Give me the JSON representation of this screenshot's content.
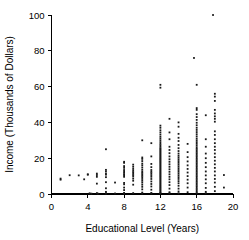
{
  "chart_data": {
    "type": "scatter",
    "title": "",
    "xlabel": "Educational Level (Years)",
    "ylabel": "Income (Thousands of Dollars)",
    "xlim": [
      0,
      20
    ],
    "ylim": [
      0,
      100
    ],
    "xticks": [
      0,
      4,
      8,
      12,
      16,
      20
    ],
    "yticks": [
      0,
      20,
      40,
      60,
      80,
      100
    ],
    "grid": false,
    "legend": null,
    "marker_color": "#1a1a1a",
    "axis_color": "#000000",
    "background": "#ffffff",
    "n_points": 330,
    "points": [
      [
        1,
        8
      ],
      [
        1,
        8.6
      ],
      [
        2,
        10.5
      ],
      [
        3,
        10.4
      ],
      [
        3.6,
        8.2
      ],
      [
        4,
        10.8
      ],
      [
        4,
        11
      ],
      [
        4.2,
        0.4
      ],
      [
        4.4,
        0.2
      ],
      [
        5,
        9.6
      ],
      [
        5,
        10.6
      ],
      [
        5,
        11.4
      ],
      [
        5,
        5.8
      ],
      [
        5,
        0.5
      ],
      [
        5.1,
        0.2
      ],
      [
        6,
        25
      ],
      [
        6,
        13.5
      ],
      [
        6,
        12.6
      ],
      [
        6,
        11.4
      ],
      [
        6,
        10.8
      ],
      [
        6,
        9.4
      ],
      [
        6,
        6.6
      ],
      [
        6,
        3.2
      ],
      [
        6,
        1.2
      ],
      [
        6,
        0.4
      ],
      [
        6,
        0.2
      ],
      [
        7,
        6.4
      ],
      [
        7,
        0.3
      ],
      [
        8,
        18
      ],
      [
        8,
        17.4
      ],
      [
        8,
        15.6
      ],
      [
        8,
        14.6
      ],
      [
        8,
        13.4
      ],
      [
        8,
        12.6
      ],
      [
        8,
        11.8
      ],
      [
        8,
        11
      ],
      [
        8,
        10.4
      ],
      [
        8,
        9.6
      ],
      [
        8,
        6.2
      ],
      [
        8,
        5.4
      ],
      [
        8,
        3.6
      ],
      [
        8,
        2.2
      ],
      [
        8,
        0.6
      ],
      [
        8,
        0.3
      ],
      [
        9,
        16.4
      ],
      [
        9,
        15.2
      ],
      [
        9,
        14
      ],
      [
        9,
        13
      ],
      [
        9,
        12.2
      ],
      [
        9,
        11.4
      ],
      [
        9,
        10.6
      ],
      [
        9,
        9.8
      ],
      [
        9,
        8.6
      ],
      [
        9,
        7.4
      ],
      [
        9,
        5.2
      ],
      [
        9,
        0.5
      ],
      [
        10,
        30
      ],
      [
        10,
        20.4
      ],
      [
        10,
        19.6
      ],
      [
        10,
        18.4
      ],
      [
        10,
        17
      ],
      [
        10,
        16
      ],
      [
        10,
        14.8
      ],
      [
        10,
        13.6
      ],
      [
        10,
        12.6
      ],
      [
        10,
        11.8
      ],
      [
        10,
        11
      ],
      [
        10,
        10.2
      ],
      [
        10,
        9.4
      ],
      [
        10,
        8.4
      ],
      [
        10,
        7.4
      ],
      [
        10,
        6.4
      ],
      [
        10,
        5.2
      ],
      [
        10,
        4
      ],
      [
        10,
        2.6
      ],
      [
        10,
        0.8
      ],
      [
        10,
        0.3
      ],
      [
        11,
        28.4
      ],
      [
        11,
        21
      ],
      [
        11,
        16.8
      ],
      [
        11,
        15
      ],
      [
        11,
        13.4
      ],
      [
        11,
        12.4
      ],
      [
        11,
        11.6
      ],
      [
        11,
        10.6
      ],
      [
        11,
        9.6
      ],
      [
        11,
        8.4
      ],
      [
        11,
        7
      ],
      [
        11,
        5.6
      ],
      [
        11,
        4.2
      ],
      [
        11,
        2.4
      ],
      [
        11,
        0.6
      ],
      [
        11,
        0.3
      ],
      [
        12,
        61
      ],
      [
        12,
        59.4
      ],
      [
        12,
        38.2
      ],
      [
        12,
        37
      ],
      [
        12,
        35.6
      ],
      [
        12,
        34.4
      ],
      [
        12,
        33.2
      ],
      [
        12,
        32
      ],
      [
        12,
        31
      ],
      [
        12,
        30
      ],
      [
        12,
        29
      ],
      [
        12,
        28
      ],
      [
        12,
        27.2
      ],
      [
        12,
        26.4
      ],
      [
        12,
        25.6
      ],
      [
        12,
        25
      ],
      [
        12,
        24.4
      ],
      [
        12,
        23.8
      ],
      [
        12,
        23.2
      ],
      [
        12,
        22.6
      ],
      [
        12,
        22
      ],
      [
        12,
        21.4
      ],
      [
        12,
        20.8
      ],
      [
        12,
        20.2
      ],
      [
        12,
        19.6
      ],
      [
        12,
        19
      ],
      [
        12,
        18.4
      ],
      [
        12,
        17.8
      ],
      [
        12,
        17.2
      ],
      [
        12,
        16.6
      ],
      [
        12,
        16
      ],
      [
        12,
        15.4
      ],
      [
        12,
        14.8
      ],
      [
        12,
        14.2
      ],
      [
        12,
        13.6
      ],
      [
        12,
        13
      ],
      [
        12,
        12.4
      ],
      [
        12,
        11.8
      ],
      [
        12,
        11.2
      ],
      [
        12,
        10.6
      ],
      [
        12,
        10
      ],
      [
        12,
        9.4
      ],
      [
        12,
        8.8
      ],
      [
        12,
        8.2
      ],
      [
        12,
        7.6
      ],
      [
        12,
        7
      ],
      [
        12,
        6.4
      ],
      [
        12,
        5.8
      ],
      [
        12,
        5.2
      ],
      [
        12,
        4.6
      ],
      [
        12,
        4
      ],
      [
        12,
        3.4
      ],
      [
        12,
        2.8
      ],
      [
        12,
        2.2
      ],
      [
        12,
        1.6
      ],
      [
        12,
        1
      ],
      [
        12,
        0.6
      ],
      [
        12,
        0.3
      ],
      [
        13,
        42
      ],
      [
        13,
        34.4
      ],
      [
        13,
        30.6
      ],
      [
        13,
        26.4
      ],
      [
        13,
        24.6
      ],
      [
        13,
        22.8
      ],
      [
        13,
        21
      ],
      [
        13,
        19.4
      ],
      [
        13,
        18
      ],
      [
        13,
        16.6
      ],
      [
        13,
        15.2
      ],
      [
        13,
        13.8
      ],
      [
        13,
        12.4
      ],
      [
        13,
        11
      ],
      [
        13,
        9.6
      ],
      [
        13,
        8.2
      ],
      [
        13,
        6.6
      ],
      [
        13,
        5
      ],
      [
        13,
        3
      ],
      [
        13,
        1
      ],
      [
        13,
        0.4
      ],
      [
        14,
        40
      ],
      [
        14,
        37.6
      ],
      [
        14,
        33.6
      ],
      [
        14,
        31.4
      ],
      [
        14,
        29.6
      ],
      [
        14,
        27.4
      ],
      [
        14,
        25.6
      ],
      [
        14,
        24
      ],
      [
        14,
        22.6
      ],
      [
        14,
        21.4
      ],
      [
        14,
        20.4
      ],
      [
        14,
        19.4
      ],
      [
        14,
        18.4
      ],
      [
        14,
        17.4
      ],
      [
        14,
        16.4
      ],
      [
        14,
        15.4
      ],
      [
        14,
        14.4
      ],
      [
        14,
        13.4
      ],
      [
        14,
        12.4
      ],
      [
        14,
        11.4
      ],
      [
        14,
        10.4
      ],
      [
        14,
        9.4
      ],
      [
        14,
        8.4
      ],
      [
        14,
        7.2
      ],
      [
        14,
        6
      ],
      [
        14,
        4.6
      ],
      [
        14,
        3
      ],
      [
        14,
        1.4
      ],
      [
        14,
        0.4
      ],
      [
        15,
        28
      ],
      [
        15,
        23.4
      ],
      [
        15,
        20.6
      ],
      [
        15,
        18.2
      ],
      [
        15,
        16
      ],
      [
        15,
        14
      ],
      [
        15,
        12
      ],
      [
        15,
        10
      ],
      [
        15,
        8
      ],
      [
        15,
        6
      ],
      [
        15,
        3.6
      ],
      [
        15,
        1
      ],
      [
        15.7,
        76
      ],
      [
        16,
        61
      ],
      [
        16,
        48
      ],
      [
        16,
        47
      ],
      [
        16,
        44.6
      ],
      [
        16,
        43
      ],
      [
        16,
        41.4
      ],
      [
        16,
        39.8
      ],
      [
        16,
        38.4
      ],
      [
        16,
        37
      ],
      [
        16,
        35.8
      ],
      [
        16,
        34.6
      ],
      [
        16,
        33.4
      ],
      [
        16,
        32.2
      ],
      [
        16,
        31
      ],
      [
        16,
        30
      ],
      [
        16,
        29
      ],
      [
        16,
        28
      ],
      [
        16,
        27
      ],
      [
        16,
        26
      ],
      [
        16,
        25.2
      ],
      [
        16,
        24.4
      ],
      [
        16,
        23.6
      ],
      [
        16,
        22.8
      ],
      [
        16,
        22
      ],
      [
        16,
        21.2
      ],
      [
        16,
        20.4
      ],
      [
        16,
        19.6
      ],
      [
        16,
        18.8
      ],
      [
        16,
        18
      ],
      [
        16,
        17.2
      ],
      [
        16,
        16.4
      ],
      [
        16,
        15.6
      ],
      [
        16,
        14.8
      ],
      [
        16,
        14
      ],
      [
        16,
        13.2
      ],
      [
        16,
        12.4
      ],
      [
        16,
        11.6
      ],
      [
        16,
        10.8
      ],
      [
        16,
        10
      ],
      [
        16,
        9.2
      ],
      [
        16,
        8.4
      ],
      [
        16,
        7.6
      ],
      [
        16,
        6.8
      ],
      [
        16,
        6
      ],
      [
        16,
        5.2
      ],
      [
        16,
        4.4
      ],
      [
        16,
        3.6
      ],
      [
        16,
        2.8
      ],
      [
        16,
        2
      ],
      [
        16,
        1.2
      ],
      [
        16,
        0.5
      ],
      [
        17,
        44
      ],
      [
        17,
        30.6
      ],
      [
        17,
        26.4
      ],
      [
        17,
        22.6
      ],
      [
        17,
        20
      ],
      [
        17,
        17.4
      ],
      [
        17,
        15
      ],
      [
        17,
        12.6
      ],
      [
        17,
        10.4
      ],
      [
        17,
        8.2
      ],
      [
        17,
        6
      ],
      [
        17,
        3.4
      ],
      [
        17,
        1.2
      ],
      [
        17,
        0.4
      ],
      [
        17.8,
        100
      ],
      [
        18,
        56
      ],
      [
        18,
        54.4
      ],
      [
        18,
        52
      ],
      [
        18,
        47
      ],
      [
        18,
        45
      ],
      [
        18,
        43.4
      ],
      [
        18,
        42
      ],
      [
        18,
        40.4
      ],
      [
        18,
        35
      ],
      [
        18,
        33
      ],
      [
        18,
        30.6
      ],
      [
        18,
        28.4
      ],
      [
        18,
        26.4
      ],
      [
        18,
        24.6
      ],
      [
        18,
        22.6
      ],
      [
        18,
        20.6
      ],
      [
        18,
        18.6
      ],
      [
        18,
        16.6
      ],
      [
        18,
        14.6
      ],
      [
        18,
        12.6
      ],
      [
        18,
        10.4
      ],
      [
        18,
        8.4
      ],
      [
        18,
        6.4
      ],
      [
        18,
        4
      ],
      [
        18,
        1.6
      ],
      [
        19,
        10.6
      ],
      [
        19,
        3.6
      ]
    ]
  }
}
